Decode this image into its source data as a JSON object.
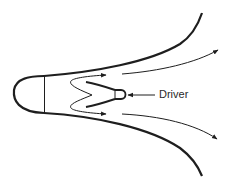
{
  "diagram": {
    "title": "",
    "labels": {
      "driver": "Driver"
    },
    "colors": {
      "stroke": "#1e1e1e",
      "background": "#ffffff"
    },
    "components": [
      {
        "name": "horn-bell-upper-wall",
        "type": "curve"
      },
      {
        "name": "horn-bell-lower-wall",
        "type": "curve"
      },
      {
        "name": "rear-chamber-cap",
        "type": "arc"
      },
      {
        "name": "rear-chamber-divider",
        "type": "line"
      },
      {
        "name": "folded-path-upper",
        "type": "arrow"
      },
      {
        "name": "folded-path-lower",
        "type": "arrow"
      },
      {
        "name": "driver",
        "type": "capsule",
        "label": "Driver"
      },
      {
        "name": "output-flow-upper",
        "type": "arrow"
      },
      {
        "name": "output-flow-lower",
        "type": "arrow"
      }
    ]
  }
}
